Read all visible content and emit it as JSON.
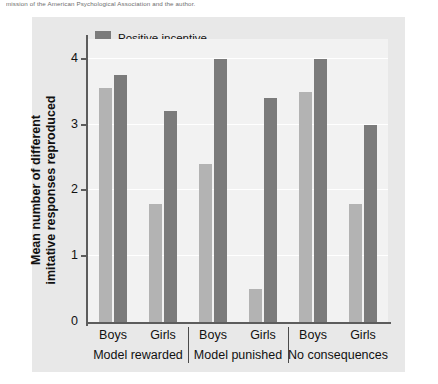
{
  "caption": {
    "fragment": "mission of the American Psychological Association and the author."
  },
  "legend": {
    "position": "top-left-inside",
    "items": [
      {
        "label": "Positive incentive",
        "swatch": "dark",
        "color": "#7b7b7b"
      },
      {
        "label": "No incentive",
        "swatch": "light",
        "color": "#b3b3b3"
      }
    ]
  },
  "axes": {
    "y_title": "Mean number of different imitative responses reproduced",
    "y_ticks": [
      "0",
      "1",
      "2",
      "3",
      "4"
    ],
    "x_sex_labels": [
      "Boys",
      "Girls",
      "Boys",
      "Girls",
      "Boys",
      "Girls"
    ],
    "x_group_labels": [
      "Model rewarded",
      "Model punished",
      "No consequences"
    ]
  },
  "chart_data": {
    "type": "bar",
    "title": "",
    "xlabel": "",
    "ylabel": "Mean number of different imitative responses reproduced",
    "ylim": [
      0,
      4.3
    ],
    "yticks": [
      0,
      1,
      2,
      3,
      4
    ],
    "grid": true,
    "legend_position": "top-left-inside",
    "groups": [
      "Model rewarded",
      "Model punished",
      "No consequences"
    ],
    "categories": [
      "Model rewarded / Boys",
      "Model rewarded / Girls",
      "Model punished / Boys",
      "Model punished / Girls",
      "No consequences / Boys",
      "No consequences / Girls"
    ],
    "series": [
      {
        "name": "No incentive",
        "color": "#b3b3b3",
        "values": [
          3.55,
          1.8,
          2.4,
          0.5,
          3.5,
          1.8
        ]
      },
      {
        "name": "Positive incentive",
        "color": "#7b7b7b",
        "values": [
          3.75,
          3.2,
          4.0,
          3.4,
          4.0,
          3.0
        ]
      }
    ],
    "bars": [
      {
        "group": "Model rewarded",
        "sex": "Boys",
        "series": "No incentive",
        "value": 3.55
      },
      {
        "group": "Model rewarded",
        "sex": "Boys",
        "series": "Positive incentive",
        "value": 3.75
      },
      {
        "group": "Model rewarded",
        "sex": "Girls",
        "series": "No incentive",
        "value": 1.8
      },
      {
        "group": "Model rewarded",
        "sex": "Girls",
        "series": "Positive incentive",
        "value": 3.2
      },
      {
        "group": "Model punished",
        "sex": "Boys",
        "series": "No incentive",
        "value": 2.4
      },
      {
        "group": "Model punished",
        "sex": "Boys",
        "series": "Positive incentive",
        "value": 4.0
      },
      {
        "group": "Model punished",
        "sex": "Girls",
        "series": "No incentive",
        "value": 0.5
      },
      {
        "group": "Model punished",
        "sex": "Girls",
        "series": "Positive incentive",
        "value": 3.4
      },
      {
        "group": "No consequences",
        "sex": "Boys",
        "series": "No incentive",
        "value": 3.5
      },
      {
        "group": "No consequences",
        "sex": "Boys",
        "series": "Positive incentive",
        "value": 4.0
      },
      {
        "group": "No consequences",
        "sex": "Girls",
        "series": "No incentive",
        "value": 1.8
      },
      {
        "group": "No consequences",
        "sex": "Girls",
        "series": "Positive incentive",
        "value": 3.0
      }
    ],
    "colors": {
      "panel_background": "#e8e8e8",
      "plot_background": "#f2f2f2",
      "gridline": "#ffffff",
      "axis": "#5c5c5c",
      "dark_bar": "#7b7b7b",
      "light_bar": "#b3b3b3"
    }
  }
}
